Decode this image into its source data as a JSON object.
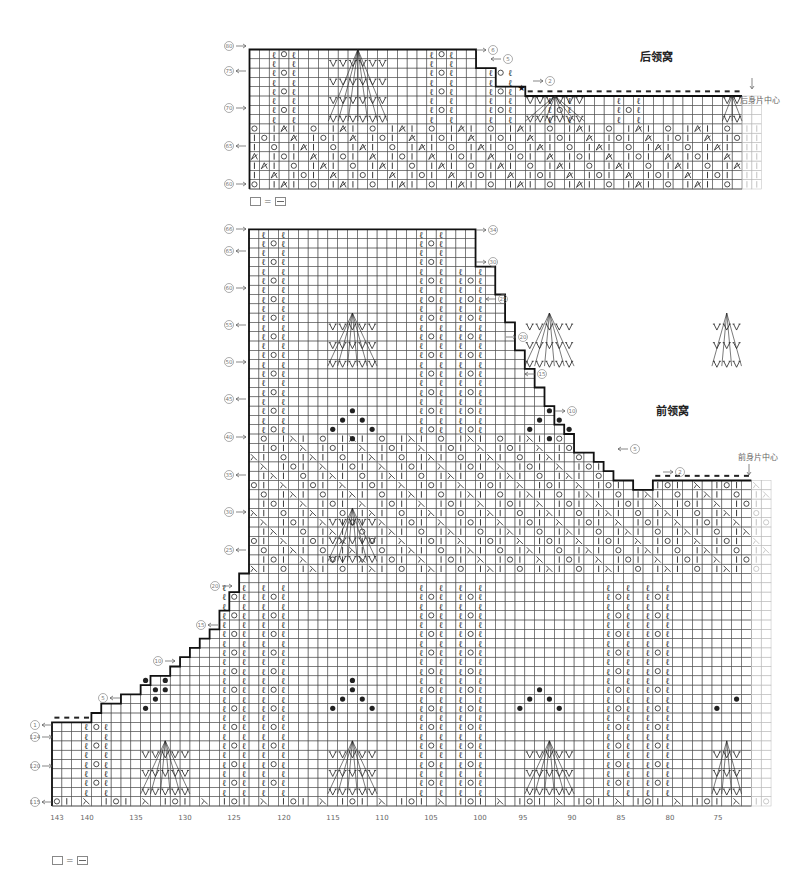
{
  "back_neck": {
    "title": "后领窝",
    "center_label": "后身片中心",
    "legend": {
      "blank": "□",
      "equals": "=",
      "symbol": "purl (−)"
    },
    "row_labels_left": [
      {
        "label": "80",
        "dir": "→"
      },
      {
        "label": "75",
        "dir": "←"
      },
      {
        "label": "70",
        "dir": "→"
      },
      {
        "label": "65",
        "dir": "←"
      },
      {
        "label": "60",
        "dir": "→"
      }
    ],
    "row_labels_right": [
      {
        "label": "6",
        "dir": "→"
      },
      {
        "label": "5",
        "dir": "←"
      },
      {
        "label": "2",
        "dir": "→"
      }
    ],
    "star_marker": "★"
  },
  "front_neck": {
    "title": "前领窝",
    "center_label": "前身片中心",
    "legend": {
      "blank": "□",
      "equals": "=",
      "symbol": "purl (−)"
    },
    "row_labels_left": [
      {
        "label": "66",
        "dir": "→"
      },
      {
        "label": "65",
        "dir": "←"
      },
      {
        "label": "60",
        "dir": "→"
      },
      {
        "label": "55",
        "dir": "←"
      },
      {
        "label": "50",
        "dir": "→"
      },
      {
        "label": "45",
        "dir": "←"
      },
      {
        "label": "40",
        "dir": "→"
      },
      {
        "label": "35",
        "dir": "←"
      },
      {
        "label": "30",
        "dir": "→"
      },
      {
        "label": "25",
        "dir": "←"
      },
      {
        "label": "20",
        "dir": "→"
      },
      {
        "label": "15",
        "dir": "←"
      },
      {
        "label": "10",
        "dir": "→"
      },
      {
        "label": "5",
        "dir": "←"
      },
      {
        "label": "1",
        "dir": "←"
      },
      {
        "label": "124",
        "dir": "→"
      },
      {
        "label": "120",
        "dir": "→"
      },
      {
        "label": "115",
        "dir": "←"
      }
    ],
    "row_labels_right": [
      {
        "label": "34",
        "dir": "→"
      },
      {
        "label": "30",
        "dir": "→"
      },
      {
        "label": "25",
        "dir": "←"
      },
      {
        "label": "20",
        "dir": "→"
      },
      {
        "label": "15",
        "dir": "←"
      },
      {
        "label": "10",
        "dir": "→"
      },
      {
        "label": "5",
        "dir": "←"
      },
      {
        "label": "2",
        "dir": "→"
      }
    ],
    "stitch_numbers": [
      "143",
      "140",
      "135",
      "130",
      "125",
      "120",
      "115",
      "110",
      "105",
      "100",
      "95",
      "90",
      "85",
      "80",
      "75"
    ]
  },
  "symbols": {
    "knit": "|",
    "yarn_over": "○",
    "right_decrease": "⋌",
    "left_decrease": "⋋",
    "twisted_knit": "ℓ",
    "bobble": "●",
    "slip": "V",
    "bind_off": "▬"
  },
  "colors": {
    "grid": "#555555",
    "outline": "#111111",
    "ghost": "#bbbbbb",
    "label": "#777777"
  }
}
